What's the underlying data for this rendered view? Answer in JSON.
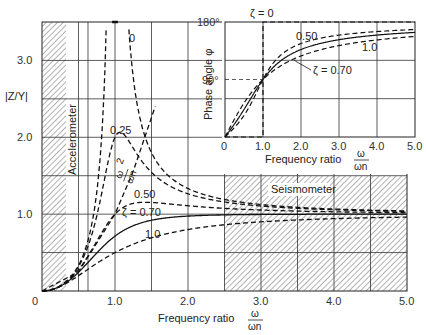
{
  "chart_data": [
    {
      "type": "line",
      "title": "",
      "xlabel": "Frequency ratio ω/ωn",
      "ylabel": "|Z/Y|",
      "xlim": [
        0,
        5.0
      ],
      "ylim": [
        0,
        3.5
      ],
      "xticks": [
        "0",
        "1.0",
        "2.0",
        "3.0",
        "4.0",
        "5.0"
      ],
      "yticks": [
        "1.0",
        "2.0",
        "3.0"
      ],
      "grid": true,
      "regions": [
        {
          "label": "Accelerometer",
          "x": [
            0,
            0.33
          ],
          "y": [
            0,
            3.5
          ],
          "hatched": true
        },
        {
          "label": "Seismometer",
          "x": [
            2.5,
            5.0
          ],
          "y": [
            0,
            1.5
          ],
          "hatched": true
        }
      ],
      "series": [
        {
          "name": "ζ = 0",
          "label": "0",
          "style": "dashed",
          "zeta": 0
        },
        {
          "name": "ζ = 0.25",
          "label": "0.25",
          "style": "dashed",
          "zeta": 0.25,
          "peak": {
            "x": 1.07,
            "y": 2.06
          }
        },
        {
          "name": "ζ = 0.50",
          "label": "0.50",
          "style": "dashed",
          "zeta": 0.5
        },
        {
          "name": "ζ = 0.70",
          "label": "ζ = 0.70",
          "style": "solid",
          "zeta": 0.7
        },
        {
          "name": "ζ = 1.0",
          "label": "1.0",
          "style": "dashed",
          "zeta": 1.0
        },
        {
          "name": "(ω/ωn)²",
          "label": "(ω/ωn)²",
          "style": "dashed",
          "x": [
            0,
            0.5,
            1.0,
            1.25,
            1.55
          ],
          "y": [
            0,
            0.25,
            1.0,
            1.56,
            2.4
          ]
        }
      ]
    },
    {
      "type": "line",
      "title": "",
      "xlabel": "Frequency ratio ω/ωn",
      "ylabel": "Phase angle φ",
      "xlim": [
        0,
        5.0
      ],
      "ylim": [
        0,
        180
      ],
      "xticks": [
        "0",
        "1.0",
        "2.0",
        "3.0",
        "4.0",
        "5.0"
      ],
      "yticks": [
        "90°",
        "180°"
      ],
      "grid": true,
      "series": [
        {
          "name": "ζ = 0",
          "label": "ζ = 0",
          "style": "dashed",
          "x": [
            0,
            1.0,
            1.0,
            5.0
          ],
          "y": [
            0,
            0,
            180,
            180
          ]
        },
        {
          "name": "ζ = 0.50",
          "label": "0.50",
          "style": "dashed",
          "zeta": 0.5
        },
        {
          "name": "ζ = 0.70",
          "label": "ζ = 0.70",
          "style": "solid",
          "zeta": 0.7
        },
        {
          "name": "ζ = 1.0",
          "label": "1.0",
          "style": "dashed",
          "zeta": 1.0
        }
      ]
    }
  ],
  "main": {
    "ylabel": "|Z/Y|",
    "xlabel": "Frequency ratio",
    "ratio_num": "ω",
    "ratio_den": "ωn",
    "accel_label": "Accelerometer",
    "seismo_label": "Seismometer",
    "curve_labels": {
      "z0": "0",
      "z025": "0.25",
      "z050": "0.50",
      "z070": "ζ = 0.70",
      "z100": "1.0",
      "sq_num": "ω",
      "sq_den": "ωn",
      "sq_exp": "2"
    }
  },
  "inset": {
    "ylabel": "Phase angle φ",
    "xlabel": "Frequency ratio",
    "ratio_num": "ω",
    "ratio_den": "ωn",
    "curve_labels": {
      "z0": "ζ = 0",
      "z050": "0.50",
      "z070": "ζ = 0.70",
      "z100": "1.0"
    }
  }
}
